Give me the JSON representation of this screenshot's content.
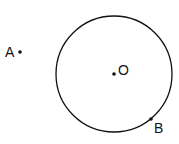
{
  "diagram": {
    "circle": {
      "cx": 114,
      "cy": 74,
      "r": 58,
      "stroke": "#111111"
    },
    "points": [
      {
        "name": "A",
        "x": 20,
        "y": 52,
        "label": "A",
        "lx": 5,
        "ly": 57
      },
      {
        "name": "O",
        "x": 114,
        "y": 74,
        "label": "O",
        "lx": 118,
        "ly": 75
      },
      {
        "name": "B",
        "x": 151,
        "y": 119,
        "label": "B",
        "lx": 154,
        "ly": 133
      }
    ]
  }
}
